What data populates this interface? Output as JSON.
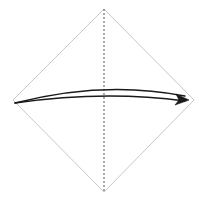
{
  "canvas": {
    "width": 206,
    "height": 201,
    "background": "#ffffff",
    "title": "Origami valley-fold diagram"
  },
  "figure": {
    "type": "origami-step-diagram",
    "description": "Square sheet shown rotated 45 degrees as a diamond, with a vertical dashed centre fold line and a curved arrow indicating the left corner folds across to the right corner.",
    "paper": {
      "name": "square-sheet",
      "orientation": "diamond",
      "stroke_color": "#c8c8c8",
      "stroke_width": 1,
      "fill": "#ffffff",
      "vertices": {
        "top": [
          104,
          9
        ],
        "right": [
          194,
          100
        ],
        "bottom": [
          104,
          192
        ],
        "left": [
          13,
          100
        ]
      }
    },
    "fold_line": {
      "name": "centre-fold-line",
      "style": "dashed",
      "stroke_color": "#555555",
      "stroke_width": 1,
      "dash_pattern": "2 2",
      "from": [
        104,
        9
      ],
      "to": [
        104,
        192
      ],
      "label": "valley fold"
    },
    "arrow": {
      "name": "fold-direction-arrow",
      "style": "double-line-curved",
      "stroke_color": "#1a1a1a",
      "stroke_width": 1.4,
      "direction": "left-to-right",
      "tail": [
        15,
        103
      ],
      "head": [
        189,
        100
      ],
      "upper_curve_control": [
        104,
        80
      ],
      "lower_curve_control": [
        104,
        90
      ],
      "head_size": 9,
      "label": "fold left corner over to right corner"
    }
  },
  "chart_data": {
    "type": "diagram",
    "shapes": [
      {
        "kind": "polygon",
        "name": "square-sheet",
        "points": [
          [
            104,
            9
          ],
          [
            194,
            100
          ],
          [
            104,
            192
          ],
          [
            13,
            100
          ]
        ],
        "stroke": "#c8c8c8",
        "fill": "#ffffff"
      },
      {
        "kind": "line",
        "name": "centre-fold-line",
        "points": [
          [
            104,
            9
          ],
          [
            104,
            192
          ]
        ],
        "stroke": "#555555",
        "dash": "2 2"
      },
      {
        "kind": "arrow",
        "name": "fold-direction-arrow",
        "points": [
          [
            15,
            103
          ],
          [
            104,
            86
          ],
          [
            189,
            100
          ]
        ],
        "stroke": "#1a1a1a",
        "double": true
      }
    ],
    "xlabel": "",
    "ylabel": "",
    "grid": false,
    "legend": "none"
  }
}
